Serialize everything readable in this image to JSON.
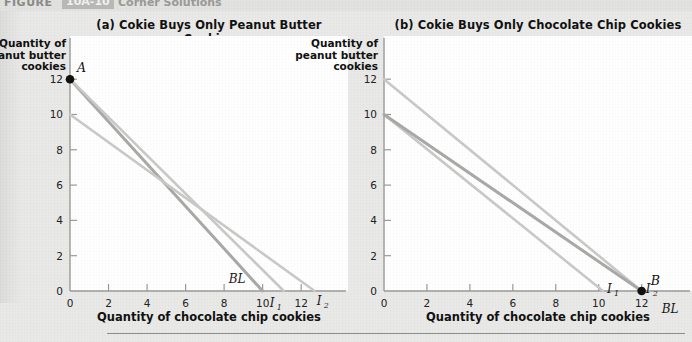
{
  "header": {
    "figure_label": "FIGURE",
    "figure_number": "10A-10",
    "figure_caption": "Corner Solutions"
  },
  "axes": {
    "y_title_lines": [
      "Quantity of",
      "peanut butter",
      "cookies"
    ],
    "x_title": "Quantity of chocolate chip cookies",
    "y_ticks": [
      0,
      2,
      4,
      6,
      8,
      10,
      12
    ],
    "x_ticks": [
      0,
      2,
      4,
      6,
      8,
      10,
      12
    ],
    "x_min": 0,
    "x_max": 13.6,
    "y_min": 0,
    "y_max": 13.2
  },
  "colors": {
    "background": "#e9e9e7",
    "canvas": "#ffffff",
    "axis": "#9a9a98",
    "budget_line": "#a9a9a7",
    "indifference_curve": "#c9c9c7",
    "point_marker": "#111111",
    "text": "#111111"
  },
  "chart_data": [
    {
      "type": "line",
      "panel": "a",
      "title": "(a) Cokie Buys Only Peanut Butter Cookies",
      "xlabel": "Quantity of chocolate chip cookies",
      "ylabel": "Quantity of peanut butter cookies",
      "xlim": [
        0,
        13.6
      ],
      "ylim": [
        0,
        13.2
      ],
      "grid": false,
      "series": [
        {
          "name": "BL",
          "role": "budget-line",
          "label": "BL",
          "label_sub": "",
          "color": "#a9a9a7",
          "x": [
            0,
            10.0
          ],
          "y": [
            12.0,
            0
          ]
        },
        {
          "name": "I1",
          "role": "indifference-curve",
          "label": "I",
          "label_sub": "1",
          "color": "#c9c9c7",
          "x": [
            0,
            11.1
          ],
          "y": [
            12.0,
            0
          ]
        },
        {
          "name": "I2",
          "role": "indifference-curve",
          "label": "I",
          "label_sub": "2",
          "color": "#c9c9c7",
          "x": [
            0,
            12.7
          ],
          "y": [
            10.0,
            0
          ]
        }
      ],
      "points": [
        {
          "name": "A",
          "label": "A",
          "x": 0,
          "y": 12,
          "marker": "filled-circle"
        }
      ]
    },
    {
      "type": "line",
      "panel": "b",
      "title": "(b) Cokie Buys Only Chocolate Chip Cookies",
      "xlabel": "Quantity of chocolate chip cookies",
      "ylabel": "Quantity of peanut butter cookies",
      "xlim": [
        0,
        13.6
      ],
      "ylim": [
        0,
        13.2
      ],
      "grid": false,
      "series": [
        {
          "name": "I2",
          "role": "indifference-curve",
          "label": "I",
          "label_sub": "2",
          "color": "#c9c9c7",
          "x": [
            0,
            12.0
          ],
          "y": [
            12.0,
            0
          ]
        },
        {
          "name": "I1",
          "role": "indifference-curve",
          "label": "I",
          "label_sub": "1",
          "color": "#c9c9c7",
          "x": [
            0,
            10.2
          ],
          "y": [
            10.0,
            0
          ]
        },
        {
          "name": "BL",
          "role": "budget-line",
          "label": "BL",
          "label_sub": "",
          "color": "#a9a9a7",
          "x": [
            0,
            12.0
          ],
          "y": [
            10.0,
            0
          ]
        }
      ],
      "points": [
        {
          "name": "B",
          "label": "B",
          "x": 12,
          "y": 0,
          "marker": "filled-circle"
        }
      ]
    }
  ]
}
